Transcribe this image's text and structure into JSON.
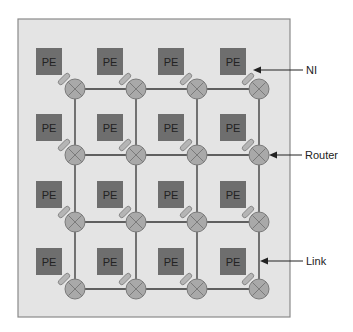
{
  "diagram": {
    "grid": {
      "rows": 4,
      "cols": 4
    },
    "pe_label": "PE",
    "callouts": [
      {
        "label": "NI",
        "target": "network-interface"
      },
      {
        "label": "Router",
        "target": "router"
      },
      {
        "label": "Link",
        "target": "link"
      }
    ],
    "colors": {
      "background": "#e4e4e4",
      "border": "#8a8a8a",
      "pe_fill": "#6e6e6e",
      "router_fill": "#a9a9a9",
      "router_stroke": "#7a7a7a",
      "ni_fill": "#b5b5b5",
      "link": "#333333"
    }
  }
}
